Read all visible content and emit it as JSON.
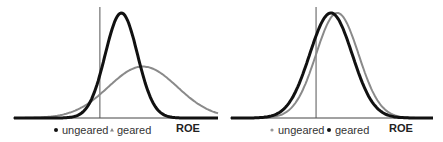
{
  "chart_data": [
    {
      "type": "line",
      "title": "",
      "xlabel": "ROE",
      "ylabel": "",
      "grid": false,
      "legend_placement": "bottom",
      "reference_line": {
        "x": 0
      },
      "xlim": [
        -4,
        5.5
      ],
      "ylim": [
        0,
        1
      ],
      "series": [
        {
          "name": "ungeared",
          "marker": "dot",
          "color": "#111111",
          "mean": 1.0,
          "sd": 0.75,
          "peak": 1.0
        },
        {
          "name": "geared",
          "marker": "triangle",
          "color": "#8a8a8a",
          "mean": 2.0,
          "sd": 1.6,
          "peak": 0.49
        }
      ],
      "legend": [
        {
          "label": "ungeared",
          "marker": "dot",
          "color": "#111111"
        },
        {
          "label": "geared",
          "marker": "triangle",
          "color": "#8a8a8a"
        }
      ]
    },
    {
      "type": "line",
      "title": "",
      "xlabel": "ROE",
      "ylabel": "",
      "grid": false,
      "legend_placement": "bottom",
      "reference_line": {
        "x": 0
      },
      "xlim": [
        -4,
        5.5
      ],
      "ylim": [
        0,
        1
      ],
      "series": [
        {
          "name": "ungeared",
          "marker": "dot",
          "color": "#8a8a8a",
          "mean": 1.0,
          "sd": 1.0,
          "peak": 1.0
        },
        {
          "name": "geared",
          "marker": "dot",
          "color": "#111111",
          "mean": 0.7,
          "sd": 1.0,
          "peak": 1.0
        }
      ],
      "legend": [
        {
          "label": "ungeared",
          "marker": "dot",
          "color": "#8a8a8a"
        },
        {
          "label": "geared",
          "marker": "dot",
          "color": "#111111"
        }
      ]
    }
  ]
}
